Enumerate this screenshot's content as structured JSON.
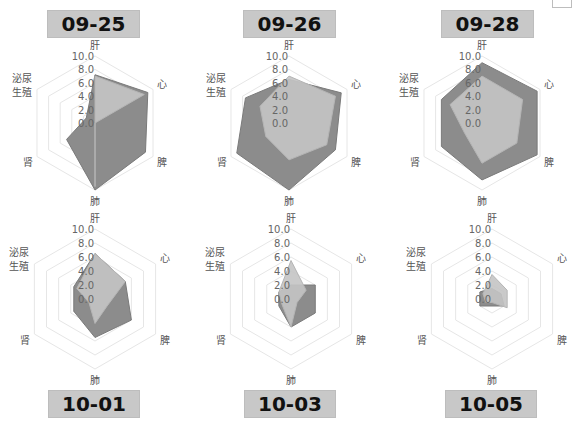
{
  "chart_data": [
    {
      "type": "radar",
      "title": "09-25",
      "axes": [
        "肝",
        "心",
        "脾",
        "肺",
        "肾",
        "泌尿生殖"
      ],
      "ticks": [
        "0.0",
        "2.0",
        "4.0",
        "6.0",
        "8.0",
        "10.0"
      ],
      "rlim": [
        0,
        10
      ],
      "series": [
        {
          "name": "series-dark",
          "color": "#8c8c8c",
          "values": [
            7.2,
            9.1,
            8.7,
            10.0,
            4.9,
            1.5
          ]
        },
        {
          "name": "series-light",
          "color": "#c4c4c4",
          "values": [
            7.0,
            8.5,
            0.0,
            9.5,
            0.0,
            0.0
          ]
        }
      ]
    },
    {
      "type": "radar",
      "title": "09-26",
      "axes": [
        "肝",
        "心",
        "脾",
        "肺",
        "肾",
        "泌尿生殖"
      ],
      "ticks": [
        "0.0",
        "2.0",
        "4.0",
        "6.0",
        "8.0",
        "10.0"
      ],
      "rlim": [
        0,
        10
      ],
      "series": [
        {
          "name": "series-dark",
          "color": "#8c8c8c",
          "values": [
            6.5,
            9.0,
            8.0,
            10.0,
            9.0,
            7.5
          ]
        },
        {
          "name": "series-light",
          "color": "#c4c4c4",
          "values": [
            7.0,
            8.0,
            6.5,
            5.5,
            4.0,
            5.0
          ]
        }
      ]
    },
    {
      "type": "radar",
      "title": "09-28",
      "axes": [
        "肝",
        "心",
        "脾",
        "肺",
        "肾",
        "泌尿生殖"
      ],
      "ticks": [
        "0.0",
        "2.0",
        "4.0",
        "6.0",
        "8.0",
        "10.0"
      ],
      "rlim": [
        0,
        10
      ],
      "series": [
        {
          "name": "series-dark",
          "color": "#8c8c8c",
          "values": [
            9.0,
            9.5,
            9.5,
            8.5,
            7.0,
            7.0
          ]
        },
        {
          "name": "series-light",
          "color": "#c4c4c4",
          "values": [
            7.0,
            7.0,
            6.0,
            6.0,
            3.0,
            5.5
          ]
        }
      ]
    },
    {
      "type": "radar",
      "title": "10-01",
      "axes": [
        "肝",
        "心",
        "脾",
        "肺",
        "肾",
        "泌尿生殖"
      ],
      "ticks": [
        "0.0",
        "2.0",
        "4.0",
        "6.0",
        "8.0",
        "10.0"
      ],
      "rlim": [
        0,
        10
      ],
      "series": [
        {
          "name": "series-dark",
          "color": "#8c8c8c",
          "values": [
            6.5,
            5.0,
            6.0,
            5.5,
            3.5,
            3.5
          ]
        },
        {
          "name": "series-light",
          "color": "#c4c4c4",
          "values": [
            6.5,
            5.0,
            2.0,
            3.5,
            1.0,
            3.0
          ]
        }
      ]
    },
    {
      "type": "radar",
      "title": "10-03",
      "axes": [
        "肝",
        "心",
        "脾",
        "肺",
        "肾",
        "泌尿生殖"
      ],
      "ticks": [
        "0.0",
        "2.0",
        "4.0",
        "6.0",
        "8.0",
        "10.0"
      ],
      "rlim": [
        0,
        10
      ],
      "series": [
        {
          "name": "series-dark",
          "color": "#8c8c8c",
          "values": [
            2.0,
            4.0,
            4.0,
            4.0,
            2.0,
            2.0
          ]
        },
        {
          "name": "series-light",
          "color": "#c4c4c4",
          "values": [
            5.5,
            2.5,
            1.0,
            4.0,
            1.5,
            2.0
          ]
        }
      ]
    },
    {
      "type": "radar",
      "title": "10-05",
      "axes": [
        "肝",
        "心",
        "脾",
        "肺",
        "肾",
        "泌尿生殖"
      ],
      "ticks": [
        "0.0",
        "2.0",
        "4.0",
        "6.0",
        "8.0",
        "10.0"
      ],
      "rlim": [
        0,
        10
      ],
      "series": [
        {
          "name": "series-dark",
          "color": "#8c8c8c",
          "values": [
            1.5,
            1.5,
            2.0,
            1.0,
            2.0,
            2.0
          ]
        },
        {
          "name": "series-light",
          "color": "#c4c4c4",
          "values": [
            3.5,
            2.5,
            2.5,
            0.5,
            1.0,
            1.5
          ]
        }
      ]
    }
  ],
  "panels": [
    {
      "title": "09-25",
      "cx": 95,
      "cy": 123,
      "r": 67,
      "title_box": {
        "x": 47,
        "y": 10,
        "w": 93,
        "h": 28
      }
    },
    {
      "title": "09-26",
      "cx": 289,
      "cy": 123,
      "r": 67,
      "title_box": {
        "x": 243,
        "y": 10,
        "w": 93,
        "h": 28
      }
    },
    {
      "title": "09-28",
      "cx": 482,
      "cy": 123,
      "r": 67,
      "title_box": {
        "x": 441,
        "y": 10,
        "w": 93,
        "h": 28
      }
    },
    {
      "title": "10-01",
      "cx": 95,
      "cy": 299,
      "r": 70,
      "title_box": {
        "x": 48,
        "y": 390,
        "w": 92,
        "h": 28
      }
    },
    {
      "title": "10-03",
      "cx": 291,
      "cy": 299,
      "r": 70,
      "title_box": {
        "x": 244,
        "y": 390,
        "w": 92,
        "h": 28
      }
    },
    {
      "title": "10-05",
      "cx": 492,
      "cy": 299,
      "r": 70,
      "title_box": {
        "x": 445,
        "y": 390,
        "w": 92,
        "h": 28
      }
    }
  ],
  "colors": {
    "grid": "#e6e6e6",
    "title_bg": "#c8c8c8",
    "dark": "#8c8c8c",
    "light": "#c8c8c8"
  }
}
